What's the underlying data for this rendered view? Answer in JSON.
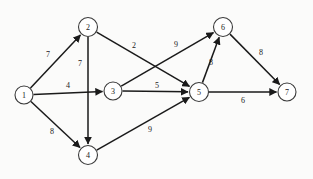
{
  "chart_data": {
    "type": "diagram",
    "title": "",
    "subtitle": "",
    "xlabel": "",
    "ylabel": "",
    "graph_kind": "directed weighted graph",
    "node_count": 7,
    "edge_count": 11,
    "nodes": [
      {
        "id": "1",
        "label": "1",
        "x": 24,
        "y": 95,
        "r": 9
      },
      {
        "id": "2",
        "label": "2",
        "x": 88,
        "y": 27,
        "r": 9.5
      },
      {
        "id": "3",
        "label": "3",
        "x": 113,
        "y": 91,
        "r": 9
      },
      {
        "id": "4",
        "label": "4",
        "x": 88,
        "y": 155,
        "r": 9.5
      },
      {
        "id": "5",
        "label": "5",
        "x": 199,
        "y": 92,
        "r": 9.5
      },
      {
        "id": "6",
        "label": "6",
        "x": 223,
        "y": 27,
        "r": 9.5
      },
      {
        "id": "7",
        "label": "7",
        "x": 287,
        "y": 92,
        "r": 9
      }
    ],
    "edges": [
      {
        "from": "1",
        "to": "2",
        "weight": 7,
        "label": "7",
        "lx": 48,
        "ly": 54
      },
      {
        "from": "1",
        "to": "3",
        "weight": 4,
        "label": "4",
        "lx": 68,
        "ly": 85
      },
      {
        "from": "1",
        "to": "4",
        "weight": 8,
        "label": "8",
        "lx": 52,
        "ly": 131
      },
      {
        "from": "2",
        "to": "4",
        "weight": 7,
        "label": "7",
        "lx": 80,
        "ly": 63
      },
      {
        "from": "2",
        "to": "5",
        "weight": 2,
        "label": "2",
        "lx": 134,
        "ly": 45
      },
      {
        "from": "3",
        "to": "5",
        "weight": 5,
        "label": "5",
        "lx": 157,
        "ly": 85
      },
      {
        "from": "3",
        "to": "6",
        "weight": 9,
        "label": "9",
        "lx": 176,
        "ly": 44
      },
      {
        "from": "4",
        "to": "5",
        "weight": 9,
        "label": "9",
        "lx": 150,
        "ly": 129
      },
      {
        "from": "5",
        "to": "6",
        "weight": 8,
        "label": "8",
        "lx": 211,
        "ly": 62
      },
      {
        "from": "5",
        "to": "7",
        "weight": 6,
        "label": "6",
        "lx": 243,
        "ly": 100
      },
      {
        "from": "6",
        "to": "7",
        "weight": 8,
        "label": "8",
        "lx": 261,
        "ly": 52
      }
    ],
    "node_labels": [
      "1",
      "2",
      "3",
      "4",
      "5",
      "6",
      "7"
    ],
    "edge_weights": [
      7,
      4,
      8,
      7,
      2,
      5,
      9,
      9,
      8,
      6,
      8
    ],
    "colors": {
      "stroke": "#1a1a1a",
      "node_fill": "#ffffff",
      "node_stroke": "#3a3a3a",
      "background": "#fbfbfa"
    }
  }
}
